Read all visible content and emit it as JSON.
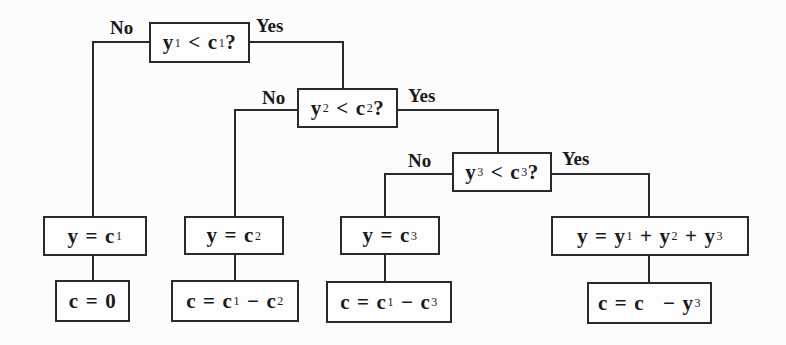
{
  "diagram": {
    "type": "decision-tree",
    "decisions": [
      {
        "id": "d1",
        "var": "y",
        "var_sub": "1",
        "op": "<",
        "const": "c",
        "const_sub": "1",
        "suffix": "?",
        "no_label": "No",
        "yes_label": "Yes"
      },
      {
        "id": "d2",
        "var": "y",
        "var_sub": "2",
        "op": "<",
        "const": "c",
        "const_sub": "2",
        "suffix": "?",
        "no_label": "No",
        "yes_label": "Yes"
      },
      {
        "id": "d3",
        "var": "y",
        "var_sub": "3",
        "op": "<",
        "const": "c",
        "const_sub": "3",
        "suffix": "?",
        "no_label": "No",
        "yes_label": "Yes"
      }
    ],
    "outcomes": [
      {
        "branch": "d1-no",
        "assign_y": {
          "lhs": "y",
          "eq": "=",
          "terms": [
            {
              "t": "c",
              "sub": "1"
            }
          ]
        },
        "assign_c": {
          "lhs": "c",
          "eq": "=",
          "terms": [
            {
              "t": "0",
              "sub": ""
            }
          ]
        }
      },
      {
        "branch": "d2-no",
        "assign_y": {
          "lhs": "y",
          "eq": "=",
          "terms": [
            {
              "t": "c",
              "sub": "2"
            }
          ]
        },
        "assign_c": {
          "lhs": "c",
          "eq": "=",
          "terms": [
            {
              "t": "c",
              "sub": "1"
            },
            {
              "op": "−"
            },
            {
              "t": "c",
              "sub": "2"
            }
          ]
        }
      },
      {
        "branch": "d3-no",
        "assign_y": {
          "lhs": "y",
          "eq": "=",
          "terms": [
            {
              "t": "c",
              "sub": "3"
            }
          ]
        },
        "assign_c": {
          "lhs": "c",
          "eq": "=",
          "terms": [
            {
              "t": "c",
              "sub": "1"
            },
            {
              "op": "−"
            },
            {
              "t": "c",
              "sub": "3"
            }
          ]
        }
      },
      {
        "branch": "d3-yes",
        "assign_y": {
          "lhs": "y",
          "eq": "=",
          "terms": [
            {
              "t": "y",
              "sub": "1"
            },
            {
              "op": "+"
            },
            {
              "t": "y",
              "sub": "2"
            },
            {
              "op": "+"
            },
            {
              "t": "y",
              "sub": "3"
            }
          ]
        },
        "assign_c": {
          "lhs": "c",
          "eq": "=",
          "terms": [
            {
              "t": "c",
              "sub": ""
            },
            {
              "op": "−"
            },
            {
              "t": "y",
              "sub": "3"
            }
          ]
        }
      }
    ]
  },
  "labels": {
    "d1": {
      "no": "No",
      "yes": "Yes"
    },
    "d2": {
      "no": "No",
      "yes": "Yes"
    },
    "d3": {
      "no": "No",
      "yes": "Yes"
    }
  },
  "text": {
    "d1": {
      "a": "y",
      "a_sub": "1",
      "op": "<",
      "b": "c",
      "b_sub": "1",
      "q": "?"
    },
    "d2": {
      "a": "y",
      "a_sub": "2",
      "op": "<",
      "b": "c",
      "b_sub": "2",
      "q": "?"
    },
    "d3": {
      "a": "y",
      "a_sub": "3",
      "op": "<",
      "b": "c",
      "b_sub": "3",
      "q": "?"
    },
    "o1y": {
      "lhs": "y",
      "eq": "=",
      "t1": "c",
      "s1": "1"
    },
    "o1c": {
      "lhs": "c",
      "eq": "=",
      "t1": "0"
    },
    "o2y": {
      "lhs": "y",
      "eq": "=",
      "t1": "c",
      "s1": "2"
    },
    "o2c": {
      "lhs": "c",
      "eq": "=",
      "t1": "c",
      "s1": "1",
      "op1": "−",
      "t2": "c",
      "s2": "2"
    },
    "o3y": {
      "lhs": "y",
      "eq": "=",
      "t1": "c",
      "s1": "3"
    },
    "o3c": {
      "lhs": "c",
      "eq": "=",
      "t1": "c",
      "s1": "1",
      "op1": "−",
      "t2": "c",
      "s2": "3"
    },
    "o4y": {
      "lhs": "y",
      "eq": "=",
      "t1": "y",
      "s1": "1",
      "op1": "+",
      "t2": "y",
      "s2": "2",
      "op2": "+",
      "t3": "y",
      "s3": "3"
    },
    "o4c": {
      "lhs": "c",
      "eq": "=",
      "t1": "c",
      "op1": "−",
      "t2": "y",
      "s2": "3"
    }
  },
  "colors": {
    "line": "#2a2a2a",
    "text": "#1a1a1a",
    "background": "#fcfcfc"
  }
}
